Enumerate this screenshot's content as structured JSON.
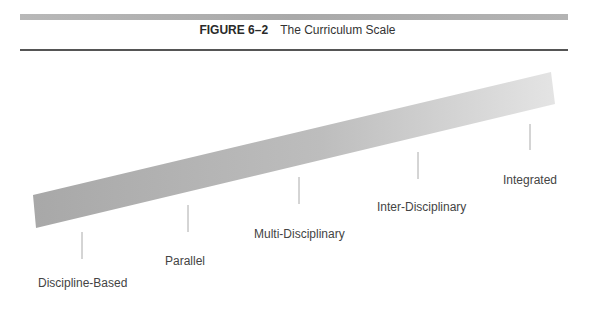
{
  "figure": {
    "number": "FIGURE 6–2",
    "caption": "The Curriculum Scale"
  },
  "scale": {
    "band_color_left": "#a9a9a9",
    "band_color_right": "#e2e2e2",
    "points": [
      {
        "label": "Discipline-Based",
        "tick_x": 82,
        "tick_y1": 232,
        "tick_y2": 259,
        "label_x": 38,
        "label_y": 276
      },
      {
        "label": "Parallel",
        "tick_x": 188,
        "tick_y1": 205,
        "tick_y2": 232,
        "label_x": 165,
        "label_y": 254
      },
      {
        "label": "Multi-Disciplinary",
        "tick_x": 299,
        "tick_y1": 177,
        "tick_y2": 204,
        "label_x": 254,
        "label_y": 227
      },
      {
        "label": "Inter-Disciplinary",
        "tick_x": 418,
        "tick_y1": 152,
        "tick_y2": 179,
        "label_x": 377,
        "label_y": 200
      },
      {
        "label": "Integrated",
        "tick_x": 530,
        "tick_y1": 124,
        "tick_y2": 150,
        "label_x": 503,
        "label_y": 173
      }
    ]
  }
}
